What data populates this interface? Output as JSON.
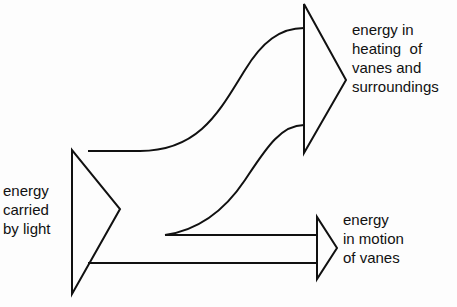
{
  "diagram": {
    "type": "energy-flow (Sankey-style)",
    "stroke_color": "#111111",
    "background_color": "#fdfdfd",
    "nodes": {
      "source": {
        "lines": [
          "energy",
          "carried",
          "by light"
        ]
      },
      "heating": {
        "lines": [
          "energy in",
          "heating  of",
          "vanes and",
          "surroundings"
        ]
      },
      "motion": {
        "lines": [
          "energy",
          "in motion",
          "of vanes"
        ]
      }
    },
    "flows": [
      {
        "from": "source",
        "to": "heating",
        "description": "large curved band"
      },
      {
        "from": "source",
        "to": "motion",
        "description": "narrow straight band"
      }
    ]
  }
}
